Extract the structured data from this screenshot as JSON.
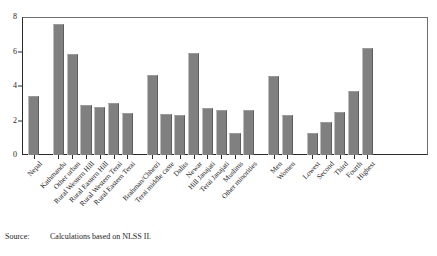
{
  "chart_data": {
    "type": "bar",
    "title": "",
    "subtitle": "",
    "xlabel": "",
    "ylabel": "",
    "ylim": [
      0,
      8
    ],
    "ytick_values": [
      0,
      2,
      4,
      6,
      8
    ],
    "ytick_labels": [
      "0",
      "2",
      "4",
      "6",
      "8"
    ],
    "grid": false,
    "legend": null,
    "bar_color": "#808080",
    "categories": [
      "Nepal",
      "Kathmandu",
      "Other urban",
      "Rural Western Hill",
      "Rural Eastern Hill",
      "Rural Western Terai",
      "Rural Eastern Terai",
      "Brahman/Chhetri",
      "Terai middle caste",
      "Dalits",
      "Newar",
      "Hill Janajati",
      "Terai Janajati",
      "Muslims",
      "Other minorities",
      "Men",
      "Women",
      "Lowest",
      "Second",
      "Third",
      "Fourth",
      "Highest"
    ],
    "values": [
      3.4,
      7.6,
      5.85,
      2.9,
      2.8,
      3.0,
      2.45,
      4.65,
      2.4,
      2.3,
      5.9,
      2.7,
      2.6,
      1.25,
      2.6,
      4.6,
      2.3,
      1.25,
      1.9,
      2.5,
      3.7,
      6.2
    ],
    "groups": [
      {
        "name": "national",
        "start": 0,
        "count": 1
      },
      {
        "name": "region",
        "start": 1,
        "count": 6
      },
      {
        "name": "caste-ethnicity",
        "start": 7,
        "count": 8
      },
      {
        "name": "gender",
        "start": 15,
        "count": 2
      },
      {
        "name": "consumption-quintile",
        "start": 17,
        "count": 5
      }
    ]
  },
  "source": {
    "label": "Source:",
    "text": "Calculations based on NLSS II."
  }
}
